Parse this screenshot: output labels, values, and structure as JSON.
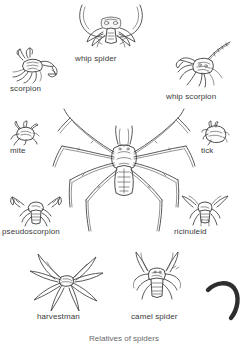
{
  "plate": {
    "title": "Relatives of spiders",
    "background_color": "#ffffff",
    "ink_color": "#3b3b3b",
    "label_color": "#3a3a3a",
    "width": 248,
    "height": 343
  },
  "center_figure": {
    "label": "spider",
    "name": "central-spider-illustration",
    "visible_label": ""
  },
  "figures": [
    {
      "id": "whip-spider",
      "label": "whip spider",
      "icon": "whip-spider-icon",
      "position": "top-center"
    },
    {
      "id": "scorpion",
      "label": "scorpion",
      "icon": "scorpion-icon",
      "position": "top-left"
    },
    {
      "id": "whip-scorpion",
      "label": "whip scorpion",
      "icon": "whip-scorpion-icon",
      "position": "top-right"
    },
    {
      "id": "mite",
      "label": "mite",
      "icon": "mite-icon",
      "position": "middle-left"
    },
    {
      "id": "tick",
      "label": "tick",
      "icon": "tick-icon",
      "position": "middle-right"
    },
    {
      "id": "pseudoscorpion",
      "label": "pseudoscorpion",
      "icon": "pseudoscorpion-icon",
      "position": "lower-left"
    },
    {
      "id": "ricinuleid",
      "label": "ricinuleid",
      "icon": "ricinuleid-icon",
      "position": "lower-right"
    },
    {
      "id": "harvestman",
      "label": "harvestman",
      "icon": "harvestman-icon",
      "position": "bottom-left"
    },
    {
      "id": "camel-spider",
      "label": "camel spider",
      "icon": "camel-spider-icon",
      "position": "bottom-center"
    }
  ],
  "decoration": {
    "hook_shape": "curved-hook-mark",
    "hook_color": "#2e2e2e"
  },
  "caption": {
    "text": "Relatives of spiders",
    "cropped": true
  }
}
